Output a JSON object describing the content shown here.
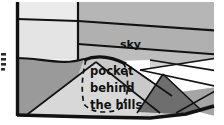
{
  "figure": {
    "title_text": "",
    "width": 224,
    "height": 125,
    "kind": "landscape-cross-section-diagram",
    "background": "#ffffff"
  },
  "labels": {
    "sky": "sky",
    "pocket_line1": "pocket",
    "pocket_line2": "behind",
    "pocket_line3": "the hills"
  },
  "palette": {
    "white": "#ffffff",
    "near_white": "#f2f2f2",
    "very_light_gray": "#e8e8e8",
    "light_gray": "#dcdcdc",
    "light_mid_gray": "#cfcfcf",
    "mid_gray": "#b4b4b4",
    "sky_gray": "#b0b0b0",
    "hill_gray": "#9a9a9a",
    "dark_gray": "#6e6e6e",
    "outline": "#121212",
    "text": "#111111"
  },
  "regions": [
    {
      "name": "upper-left-pale-panel",
      "fill": "#ebebeb"
    },
    {
      "name": "upper-right-gray-panel",
      "fill": "#b6b6b6"
    },
    {
      "name": "mid-left-pale-panel",
      "fill": "#e4e4e4"
    },
    {
      "name": "sky-band",
      "fill": "#b0b0b0"
    },
    {
      "name": "sky-lower-wedge",
      "fill": "#bdbdbd"
    },
    {
      "name": "left-foreground-hill",
      "fill": "#9a9a9a"
    },
    {
      "name": "central-light-hill",
      "fill": "#c9c9c9"
    },
    {
      "name": "bottom-pale-slope",
      "fill": "#d8d8d8"
    },
    {
      "name": "right-white-wedge",
      "fill": "#ffffff"
    },
    {
      "name": "right-dark-hill",
      "fill": "#6e6e6e"
    },
    {
      "name": "right-mid-hill",
      "fill": "#a5a5a5"
    },
    {
      "name": "far-right-light",
      "fill": "#d2d2d2"
    }
  ],
  "annotation": {
    "dashed_outline_name": "pocket-region-dashed-outline",
    "crest_name": "hill-crest-heavy-line"
  },
  "left_margin_marks": {
    "count": 4,
    "description": "cropped-text-fragment"
  }
}
